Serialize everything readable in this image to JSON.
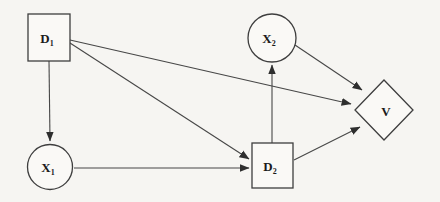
{
  "figure": {
    "background_color": "#f6f5f2",
    "line_color": "#474747",
    "shape_outline_color": "#3e3e3e",
    "text_color": "#1b1b1b"
  },
  "diagram": {
    "type": "influence-diagram",
    "nodes": [
      {
        "id": "D1",
        "shape": "square",
        "label": "D",
        "subscript": "1"
      },
      {
        "id": "X1",
        "shape": "circle",
        "label": "X",
        "subscript": "1"
      },
      {
        "id": "X2",
        "shape": "circle",
        "label": "X",
        "subscript": "2"
      },
      {
        "id": "D2",
        "shape": "square",
        "label": "D",
        "subscript": "2"
      },
      {
        "id": "V",
        "shape": "diamond",
        "label": "V",
        "subscript": ""
      }
    ],
    "edges": [
      {
        "from": "D1",
        "to": "X1"
      },
      {
        "from": "D1",
        "to": "D2"
      },
      {
        "from": "D1",
        "to": "V"
      },
      {
        "from": "X1",
        "to": "D2"
      },
      {
        "from": "D2",
        "to": "X2"
      },
      {
        "from": "D2",
        "to": "V"
      },
      {
        "from": "X2",
        "to": "V"
      }
    ]
  }
}
